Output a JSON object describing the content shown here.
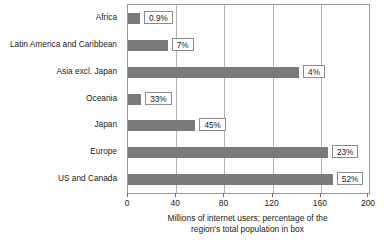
{
  "chart_data": {
    "type": "bar",
    "orientation": "horizontal",
    "title": "",
    "xlabel": "Millions of internet users; percentage of the region's total population in box",
    "ylabel": "",
    "xlim": [
      0,
      200
    ],
    "xticks": [
      "0",
      "40",
      "80",
      "120",
      "160",
      "200"
    ],
    "grid": true,
    "legend": false,
    "categories": [
      "Africa",
      "Latin America and Caribbean",
      "Asia excl. Japan",
      "Oceania",
      "Japan",
      "Europe",
      "US and Canada"
    ],
    "values": [
      10,
      33,
      142,
      11,
      56,
      166,
      170
    ],
    "annotations": [
      "0.9%",
      "7%",
      "4%",
      "33%",
      "45%",
      "23%",
      "52%"
    ],
    "series_name": "Millions of internet users"
  },
  "caption": {
    "line1": "Millions of internet users; percentage of the",
    "line2": "region's total population in box"
  },
  "colors": {
    "bar": "#7a7a7a",
    "gridline": "#b4b4b4",
    "frame": "#9a9a9a",
    "box_border": "#8c8c8c",
    "background": "#ffffff",
    "text": "#1a1a1a"
  }
}
